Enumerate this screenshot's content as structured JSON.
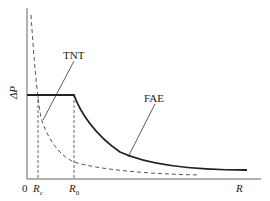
{
  "figure": {
    "y_axis_label": "ΔP",
    "x_axis_label": "R",
    "origin_label": "0",
    "ticks": [
      {
        "base": "R",
        "sub": "c"
      },
      {
        "base": "R",
        "sub": "0"
      }
    ],
    "curves": [
      {
        "name": "TNT",
        "style": "dashed",
        "description": "pressure decays steeply with distance"
      },
      {
        "name": "FAE",
        "style": "solid-thick",
        "description": "constant pressure up to R0, then decays"
      }
    ],
    "annotations": {
      "tnt_label": "TNT",
      "fae_label": "FAE"
    },
    "colors": {
      "line": "#222222",
      "axis": "#666666"
    }
  }
}
